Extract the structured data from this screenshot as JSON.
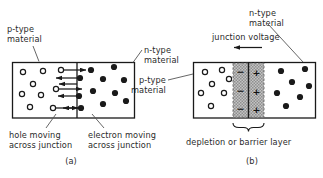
{
  "figure": {
    "title": "",
    "panels": [
      {
        "id": "a",
        "caption": "(a)",
        "labels": {
          "p_type": "p-type\nmaterial",
          "n_type": "n-type\nmaterial",
          "hole_note": "hole moving\nacross junction",
          "electron_note": "electron moving\nacross junction"
        },
        "region_left": "p-type",
        "region_right": "n-type",
        "carriers": {
          "holes_symbol": "open-circle",
          "electrons_symbol": "filled-circle",
          "hole_count_left": 8,
          "electron_count_right": 10,
          "crossing_arrows": 7
        }
      },
      {
        "id": "b",
        "caption": "(b)",
        "labels": {
          "n_type": "n-type\nmaterial",
          "p_type": "p-type\nmaterial",
          "junction_voltage": "junction voltage",
          "depletion": "depletion or barrier layer"
        },
        "depletion": {
          "negative_sign": "−",
          "positive_sign": "+",
          "rows": 3,
          "left_sign": "−",
          "right_sign": "+"
        },
        "carriers": {
          "holes_symbol": "open-circle",
          "electrons_symbol": "filled-circle",
          "hole_count_left": 7,
          "electron_count_right": 7
        }
      }
    ],
    "colors": {
      "stroke": "#1a1a1a",
      "text": "#2b2b2b",
      "depletion_fill": "#b9b9b9",
      "background": "#ffffff"
    }
  }
}
